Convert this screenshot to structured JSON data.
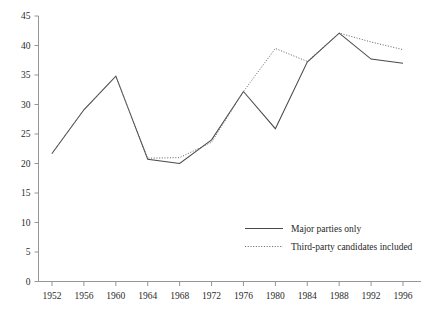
{
  "chart_data": {
    "type": "line",
    "title": "",
    "xlabel": "",
    "ylabel": "",
    "categories": [
      "1952",
      "1956",
      "1960",
      "1964",
      "1968",
      "1972",
      "1976",
      "1980",
      "1984",
      "1988",
      "1992",
      "1996"
    ],
    "x": [
      1952,
      1956,
      1960,
      1964,
      1968,
      1972,
      1976,
      1980,
      1984,
      1988,
      1992,
      1996
    ],
    "series": [
      {
        "name": "Major parties only",
        "style": "solid",
        "color": "#4a4a4a",
        "values": [
          21.7,
          29.1,
          34.8,
          20.7,
          20.0,
          24.0,
          32.2,
          25.9,
          37.2,
          42.1,
          37.7,
          37.0
        ]
      },
      {
        "name": "Third-party candidates included",
        "style": "dotted",
        "color": "#6e6e6e",
        "values": [
          21.7,
          29.1,
          34.8,
          20.9,
          21.0,
          23.6,
          32.2,
          39.5,
          37.3,
          42.1,
          40.6,
          39.3
        ]
      }
    ],
    "ylim": [
      0,
      45
    ],
    "ytick_values": [
      0,
      5,
      10,
      15,
      20,
      25,
      30,
      35,
      40,
      45
    ],
    "ytick_labels": [
      "0",
      "5",
      "10",
      "15",
      "20",
      "25",
      "30",
      "35",
      "40",
      "45"
    ],
    "xtick_labels": [
      "1952",
      "1956",
      "1960",
      "1964",
      "1968",
      "1972",
      "1976",
      "1980",
      "1984",
      "1988",
      "1992",
      "1996"
    ],
    "grid": false,
    "legend_position": "inside-lower-right",
    "axis_color": "#8a8a8a"
  },
  "legend": {
    "entries": [
      {
        "label": "Major parties only"
      },
      {
        "label": "Third-party candidates included"
      }
    ]
  },
  "clipped_header": {
    "text": ""
  }
}
